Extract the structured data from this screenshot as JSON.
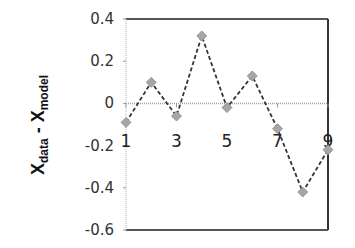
{
  "chart_data": {
    "type": "line",
    "title": "",
    "xlabel": "",
    "ylabel": "X_data - X_model",
    "ylabel_parts": {
      "main1": "X",
      "sub1": "data",
      "sep": " - ",
      "main2": "X",
      "sub2": "model"
    },
    "x": [
      1,
      2,
      3,
      4,
      5,
      6,
      7,
      8,
      9
    ],
    "series": [
      {
        "name": "residual",
        "values": [
          -0.09,
          0.1,
          -0.06,
          0.32,
          -0.02,
          0.13,
          -0.12,
          -0.42,
          -0.22
        ],
        "marker": "diamond",
        "line_style": "dashed",
        "marker_color": "#a6a6a6",
        "line_color": "#333333"
      }
    ],
    "xticks": [
      1,
      3,
      5,
      7,
      9
    ],
    "xtick_labels": [
      "1",
      "3",
      "5",
      "7",
      "9"
    ],
    "yticks": [
      0.4,
      0.2,
      0,
      -0.2,
      -0.4,
      -0.6
    ],
    "ytick_labels": [
      "0.4",
      "0.2",
      "0",
      "-0.2",
      "-0.4",
      "-0.6"
    ],
    "xlim": [
      1,
      9
    ],
    "ylim": [
      -0.6,
      0.4
    ],
    "grid": false,
    "legend": null,
    "zero_line": true
  }
}
